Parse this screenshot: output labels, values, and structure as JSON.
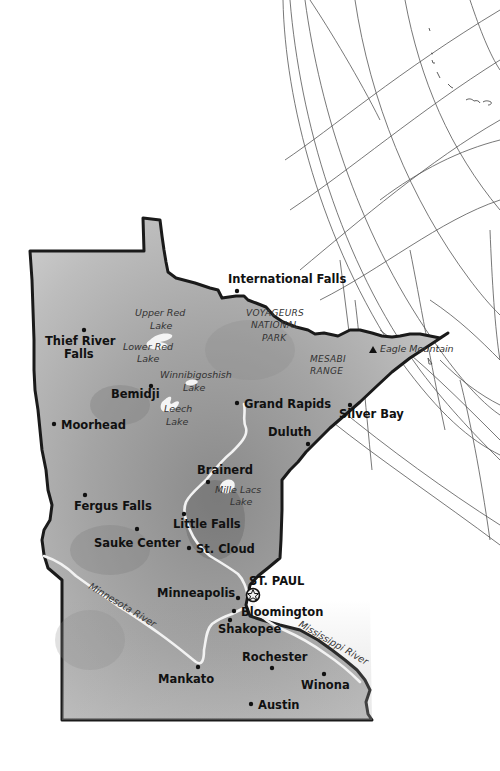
{
  "map": {
    "state": "Minnesota",
    "colors": {
      "land_light": "#c8c8c8",
      "land_mid": "#9a9a9a",
      "land_dark": "#6e6e6e",
      "border": "#1a1a1a",
      "river": "#f2f2f2",
      "lake": "#f5f5f5",
      "grid": "#444444",
      "background": "#ffffff"
    },
    "cities": [
      {
        "name": "International Falls",
        "label": "International Falls"
      },
      {
        "name": "Thief River Falls",
        "label_line1": "Thief River",
        "label_line2": "Falls"
      },
      {
        "name": "Bemidji",
        "label": "Bemidji"
      },
      {
        "name": "Grand Rapids",
        "label": "Grand Rapids"
      },
      {
        "name": "Silver Bay",
        "label": "Silver Bay"
      },
      {
        "name": "Duluth",
        "label": "Duluth"
      },
      {
        "name": "Moorhead",
        "label": "Moorhead"
      },
      {
        "name": "Brainerd",
        "label": "Brainerd"
      },
      {
        "name": "Fergus Falls",
        "label": "Fergus Falls"
      },
      {
        "name": "Little Falls",
        "label": "Little Falls"
      },
      {
        "name": "Sauke Center",
        "label": "Sauke Center"
      },
      {
        "name": "St. Cloud",
        "label": "St. Cloud"
      },
      {
        "name": "St. Paul",
        "label": "ST. PAUL",
        "capital": true
      },
      {
        "name": "Minneapolis",
        "label": "Minneapolis"
      },
      {
        "name": "Bloomington",
        "label": "Bloomington"
      },
      {
        "name": "Shakopee",
        "label": "Shakopee"
      },
      {
        "name": "Rochester",
        "label": "Rochester"
      },
      {
        "name": "Mankato",
        "label": "Mankato"
      },
      {
        "name": "Winona",
        "label": "Winona"
      },
      {
        "name": "Austin",
        "label": "Austin"
      }
    ],
    "lakes": [
      {
        "line1": "Upper Red",
        "line2": "Lake"
      },
      {
        "line1": "Lower Red",
        "line2": "Lake"
      },
      {
        "line1": "Winnibigoshish",
        "line2": "Lake"
      },
      {
        "line1": "Leech",
        "line2": "Lake"
      },
      {
        "line1": "Mille Lacs",
        "line2": "Lake"
      }
    ],
    "regions": [
      {
        "line1": "VOYAGEURS",
        "line2": "NATIONAL",
        "line3": "PARK"
      },
      {
        "line1": "MESABI",
        "line2": "RANGE"
      }
    ],
    "landmarks": [
      {
        "name": "Eagle Mountain",
        "label": "Eagle Mountain",
        "symbol": "triangle"
      }
    ],
    "rivers": [
      {
        "name": "Minnesota River",
        "label": "Minnesota River"
      },
      {
        "name": "Mississippi River",
        "label": "Mississippi River"
      }
    ],
    "icons": {
      "capital": "star-in-circle-icon",
      "city": "dot-icon",
      "mountain": "triangle-icon"
    }
  }
}
